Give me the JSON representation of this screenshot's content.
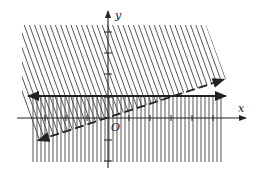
{
  "diagram": {
    "type": "coordinate-plane-inequality-regions",
    "labels": {
      "x_axis": "x",
      "y_axis": "y",
      "origin": "O"
    },
    "colors": {
      "ink": "#222222",
      "hatch": "#444444",
      "background": "#ffffff"
    },
    "geometry": {
      "origin_px": [
        108,
        118
      ],
      "unit_px": 21,
      "x_axis": {
        "from": [
          17,
          118
        ],
        "to": [
          247,
          118
        ]
      },
      "y_axis": {
        "from": [
          108,
          168
        ],
        "to": [
          108,
          10
        ]
      },
      "x_ticks_px": [
        45,
        66,
        87,
        129,
        150,
        171,
        192,
        213
      ],
      "y_ticks_px": [
        32,
        53,
        74,
        97,
        140,
        161
      ],
      "solid_line": {
        "from": [
          26,
          96
        ],
        "to": [
          228,
          96
        ],
        "style": "solid",
        "arrows": "both"
      },
      "dashed_line": {
        "from": [
          36,
          141
        ],
        "to": [
          226,
          79
        ],
        "style": "dashed",
        "arrows": "both"
      },
      "diagonal_hatch_region": {
        "top_y": 25,
        "left_x": 22,
        "right_x": 206,
        "bottom": "dashed_line"
      },
      "vertical_hatch_region": {
        "top": "solid_line",
        "bottom_y": 162,
        "left_x": 33,
        "right_x": 222,
        "spacing": 4
      }
    }
  }
}
